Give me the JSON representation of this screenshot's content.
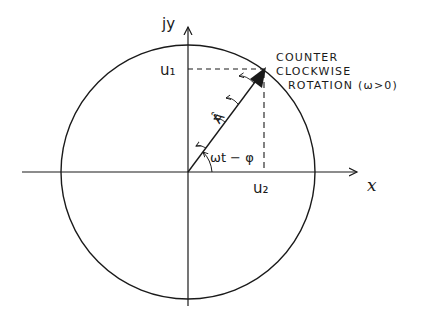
{
  "diagram": {
    "type": "phasor-diagram",
    "axes": {
      "x_label": "x",
      "y_label": "jy"
    },
    "vector": {
      "label": "Â",
      "angle_label": "ωt − φ"
    },
    "projections": {
      "vertical_label": "u₁",
      "horizontal_label": "u₂"
    },
    "annotation": {
      "line1": "COUNTER",
      "line2": "CLOCKWISE",
      "line3": "ROTATION (ω>0)"
    },
    "colors": {
      "ink": "#1a1a1a",
      "background": "#ffffff"
    }
  }
}
